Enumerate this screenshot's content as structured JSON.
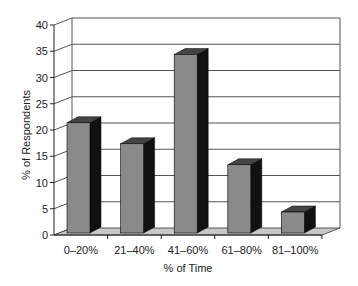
{
  "chart_data": {
    "type": "bar",
    "style": "3d",
    "title": "",
    "xlabel": "% of Time",
    "ylabel": "% of Respondents",
    "categories": [
      "0–20%",
      "21–40%",
      "41–60%",
      "61–80%",
      "81–100%"
    ],
    "values": [
      21,
      17,
      34,
      13,
      4
    ],
    "ylim": [
      0,
      40
    ],
    "yticks": [
      0,
      5,
      10,
      15,
      20,
      25,
      30,
      35,
      40
    ],
    "grid": true,
    "legend": null,
    "colors": {
      "bar_front": "#8a8a8a",
      "bar_side": "#111111",
      "bar_top": "#444444",
      "floor": "#c8c8c8",
      "grid": "#555555"
    }
  }
}
